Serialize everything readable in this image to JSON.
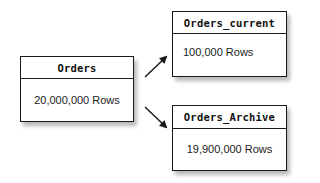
{
  "diagram": {
    "type": "table-partitioning",
    "source_table": {
      "name": "Orders",
      "rows": "20,000,000 Rows"
    },
    "target_tables": [
      {
        "name": "Orders_current",
        "rows": "100,000 Rows"
      },
      {
        "name": "Orders_Archive",
        "rows": "19,900,000 Rows"
      }
    ],
    "edges": [
      {
        "from": "Orders",
        "to": "Orders_current",
        "direction": "up-right"
      },
      {
        "from": "Orders",
        "to": "Orders_Archive",
        "direction": "down-right"
      }
    ],
    "colors": {
      "stroke": "#1a1a1a",
      "background": "#ffffff",
      "shadow": "#b8b8b8"
    }
  }
}
